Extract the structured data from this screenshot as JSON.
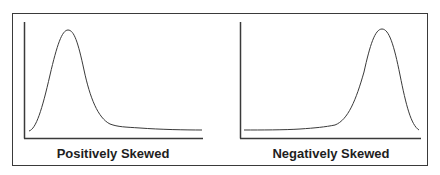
{
  "panels": [
    {
      "label": "Positively Skewed",
      "skew": "positive"
    },
    {
      "label": "Negatively Skewed",
      "skew": "negative"
    }
  ],
  "colors": {
    "line": "#3a3a3a",
    "text": "#1e1e1e",
    "background": "#ffffff"
  }
}
